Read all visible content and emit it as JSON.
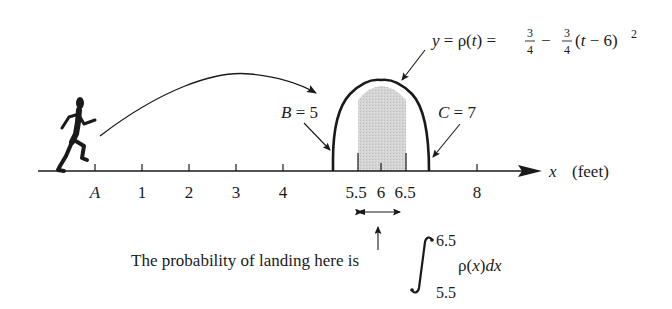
{
  "diagram": {
    "formula": {
      "lhs": "y = ρ(t) =",
      "frac1_num": "3",
      "frac1_den": "4",
      "minus": "−",
      "frac2_num": "3",
      "frac2_den": "4",
      "tail": "(t − 6)",
      "exponent": "2"
    },
    "labels": {
      "B": "B = 5",
      "C": "C = 7",
      "axis_var": "x",
      "axis_unit": "(feet)"
    },
    "ticks": [
      {
        "label": "A",
        "italic": true
      },
      {
        "label": "1"
      },
      {
        "label": "2"
      },
      {
        "label": "3"
      },
      {
        "label": "4"
      },
      {
        "label": "5.5"
      },
      {
        "label": "6"
      },
      {
        "label": "6.5"
      },
      {
        "label": "8"
      }
    ],
    "caption": {
      "text": "The probability of landing here is",
      "integral_upper": "6.5",
      "integral_lower": "5.5",
      "integrand": "ρ(x)dx"
    },
    "colors": {
      "ink": "#1a1a1a",
      "shade": "#cfcfcf"
    }
  }
}
